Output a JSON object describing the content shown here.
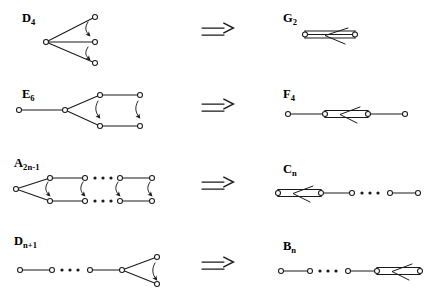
{
  "figure": {
    "type": "dynkin-folding-diagram",
    "background_color": "#ffffff",
    "ink_color": "#1a1a1a",
    "node_fill": "#ffffff",
    "rows": [
      {
        "id": "row-1",
        "source": {
          "name": "D",
          "subscript": "4",
          "label_text": "D4",
          "nodes": 4,
          "shape": "star-three-branch",
          "fold_arrows": 2
        },
        "relation_symbol": "⇒",
        "target": {
          "name": "G",
          "subscript": "2",
          "label_text": "G2",
          "nodes": 2,
          "bond": "triple",
          "arrow_direction": "left"
        }
      },
      {
        "id": "row-2",
        "source": {
          "name": "E",
          "subscript": "6",
          "label_text": "E6",
          "nodes": 6,
          "shape": "branched-two-rows",
          "fold_arrows": 2
        },
        "relation_symbol": "⇒",
        "target": {
          "name": "F",
          "subscript": "4",
          "label_text": "F4",
          "nodes": 4,
          "bond": "double",
          "arrow_direction": "left"
        }
      },
      {
        "id": "row-3",
        "source": {
          "name": "A",
          "subscript": "2n-1",
          "label_text": "A2n-1",
          "nodes": 9,
          "shape": "two-rows-with-ellipsis",
          "fold_arrows": 4,
          "ellipsis": "· · ·"
        },
        "relation_symbol": "⇒",
        "target": {
          "name": "C",
          "subscript": "n",
          "label_text": "Cn",
          "nodes": 4,
          "bond": "double",
          "bond_position": "left",
          "arrow_direction": "left",
          "ellipsis": "· · ·"
        }
      },
      {
        "id": "row-4",
        "source": {
          "name": "D",
          "subscript": "n+1",
          "label_text": "Dn+1",
          "nodes": 6,
          "shape": "chain-with-fork",
          "fold_arrows": 1,
          "ellipsis": "· · ·"
        },
        "relation_symbol": "⇒",
        "target": {
          "name": "B",
          "subscript": "n",
          "label_text": "Bn",
          "nodes": 4,
          "bond": "double",
          "bond_position": "right",
          "arrow_direction": "left",
          "ellipsis": "· · ·"
        }
      }
    ],
    "labels": {
      "d4_name": "D",
      "d4_sub": "4",
      "g2_name": "G",
      "g2_sub": "2",
      "e6_name": "E",
      "e6_sub": "6",
      "f4_name": "F",
      "f4_sub": "4",
      "a_name": "A",
      "a_sub": "2n-1",
      "c_name": "C",
      "c_sub": "n",
      "dn_name": "D",
      "dn_sub": "n+1",
      "b_name": "B",
      "b_sub": "n"
    }
  }
}
